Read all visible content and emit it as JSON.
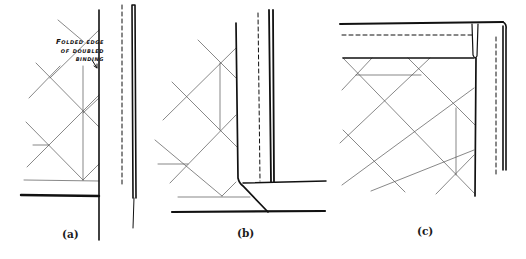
{
  "figure": {
    "callout": {
      "line1": "Folded edge",
      "line2": "of doubled",
      "line3": "binding"
    },
    "panels": [
      {
        "id": "a",
        "caption": "(a)"
      },
      {
        "id": "b",
        "caption": "(b)"
      },
      {
        "id": "c",
        "caption": "(c)"
      }
    ],
    "colors": {
      "ink": "#111111",
      "quilting": "#555555",
      "background": "#ffffff"
    }
  }
}
